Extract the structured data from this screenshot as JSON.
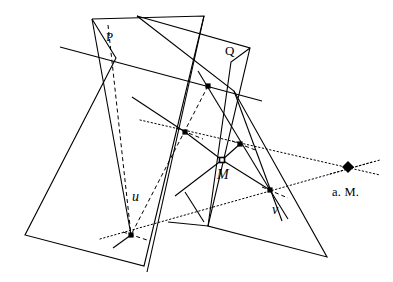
{
  "figure": {
    "width": 393,
    "height": 282,
    "background": "#ffffff",
    "stroke_color": "#000000",
    "labels": {
      "plane_p": "P",
      "plane_q": "Q",
      "line_u": "u",
      "line_v": "v",
      "point_m": "M",
      "point_am": "a. M."
    },
    "marked_points": [
      {
        "name": "node-upper-left-cross",
        "x": 116,
        "y": 58,
        "marker": "none"
      },
      {
        "name": "node-upper-mid-dot",
        "x": 208,
        "y": 86,
        "marker": "square"
      },
      {
        "name": "node-upper-right-cross",
        "x": 234,
        "y": 91,
        "marker": "none"
      },
      {
        "name": "node-mid-left-dot",
        "x": 185,
        "y": 132,
        "marker": "square"
      },
      {
        "name": "node-mid-right-dot",
        "x": 240,
        "y": 144,
        "marker": "square"
      },
      {
        "name": "node-center-m",
        "x": 222,
        "y": 160,
        "marker": "square-open"
      },
      {
        "name": "node-lower-right-dot",
        "x": 270,
        "y": 190,
        "marker": "square"
      },
      {
        "name": "node-lower-left-dot",
        "x": 131,
        "y": 235,
        "marker": "square"
      },
      {
        "name": "node-absolute-point",
        "x": 348,
        "y": 167,
        "marker": "diamond"
      }
    ],
    "label_positions": {
      "plane_p": {
        "x": 106,
        "y": 30
      },
      "plane_q": {
        "x": 225,
        "y": 44
      },
      "line_u": {
        "x": 132,
        "y": 190
      },
      "line_v": {
        "x": 272,
        "y": 203
      },
      "point_m": {
        "x": 217,
        "y": 168
      },
      "point_am": {
        "x": 332,
        "y": 186
      }
    },
    "solid_polylines": [
      {
        "name": "plane-p-quadrilateral",
        "points": "92,19 116,58 25,235 144,266 204,16 92,19"
      },
      {
        "name": "plane-q-outline",
        "points": "137,16 250,48 208,226 327,257 234,91 137,16"
      },
      {
        "name": "plane-q-notch",
        "points": "250,48 231,62 208,226 168,222"
      }
    ],
    "solid_segments": [
      {
        "name": "transversal-long-line",
        "x1": 60,
        "y1": 47,
        "x2": 262,
        "y2": 101
      },
      {
        "name": "line-u-ray",
        "x1": 92,
        "y1": 19,
        "x2": 131,
        "y2": 235
      },
      {
        "name": "line-u-extension",
        "x1": 131,
        "y1": 235,
        "x2": 113,
        "y2": 248
      },
      {
        "name": "line-q-left-edge",
        "x1": 204,
        "y1": 16,
        "x2": 147,
        "y2": 272
      },
      {
        "name": "chord-upper-to-mid",
        "x1": 132,
        "y1": 97,
        "x2": 185,
        "y2": 132
      },
      {
        "name": "chord-mid-to-center",
        "x1": 185,
        "y1": 132,
        "x2": 222,
        "y2": 160
      },
      {
        "name": "chord-center-to-midright",
        "x1": 222,
        "y1": 160,
        "x2": 240,
        "y2": 144
      },
      {
        "name": "chord-center-to-lowerright",
        "x1": 222,
        "y1": 160,
        "x2": 270,
        "y2": 190
      },
      {
        "name": "chord-center-to-lowerleft",
        "x1": 222,
        "y1": 160,
        "x2": 175,
        "y2": 196
      },
      {
        "name": "ray-from-upper-dot-down",
        "x1": 198,
        "y1": 71,
        "x2": 270,
        "y2": 190
      },
      {
        "name": "ray-from-upper-dot-down-ext",
        "x1": 270,
        "y1": 190,
        "x2": 288,
        "y2": 219
      },
      {
        "name": "ray-q-apex-down",
        "x1": 234,
        "y1": 91,
        "x2": 282,
        "y2": 221
      },
      {
        "name": "bracket-short",
        "x1": 185,
        "y1": 192,
        "x2": 204,
        "y2": 222
      }
    ],
    "dashed_segments": [
      {
        "name": "dashed-p-to-lowerleft",
        "x1": 108,
        "y1": 25,
        "x2": 131,
        "y2": 235
      },
      {
        "name": "dashed-upperdot-to-lowerleft",
        "x1": 208,
        "y1": 86,
        "x2": 131,
        "y2": 235
      },
      {
        "name": "dashed-middot-tick",
        "x1": 176,
        "y1": 128,
        "x2": 203,
        "y2": 139
      },
      {
        "name": "dashed-midright-tick",
        "x1": 232,
        "y1": 141,
        "x2": 258,
        "y2": 151
      },
      {
        "name": "dashed-lowerright-tick",
        "x1": 262,
        "y1": 187,
        "x2": 288,
        "y2": 198
      },
      {
        "name": "dashed-lowerleft-tick",
        "x1": 123,
        "y1": 232,
        "x2": 150,
        "y2": 241
      }
    ],
    "dotted_segments": [
      {
        "name": "dotted-polar-upper",
        "x1": 140,
        "y1": 120,
        "x2": 380,
        "y2": 175
      },
      {
        "name": "dotted-polar-lower",
        "x1": 100,
        "y1": 239,
        "x2": 380,
        "y2": 160
      },
      {
        "name": "dotted-am-tick",
        "x1": 330,
        "y1": 174,
        "x2": 372,
        "y2": 162
      }
    ],
    "line_styles": {
      "solid_width": 1.1,
      "dashed_width": 1.0,
      "dashed_pattern": "4,3",
      "dotted_width": 1.0,
      "dotted_pattern": "1.4,2.4"
    }
  }
}
